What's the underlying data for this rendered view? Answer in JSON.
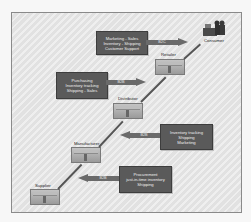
{
  "diagram": {
    "type": "supply-chain",
    "nodes": [
      {
        "id": "consumer",
        "label": "Consumer"
      },
      {
        "id": "retailer",
        "label": "Retailer"
      },
      {
        "id": "distributor",
        "label": "Distributor"
      },
      {
        "id": "manufacturer",
        "label": "Manufacturer"
      },
      {
        "id": "supplier",
        "label": "Supplier"
      }
    ],
    "infoboxes": [
      {
        "lines": [
          "Marketing - Sales",
          "Inventory - Shipping",
          "Customer Support"
        ],
        "arrow_label": "B2C",
        "direction": "right"
      },
      {
        "lines": [
          "Purchasing",
          "Inventory tracking",
          "Shipping - Sales"
        ],
        "arrow_label": "B2B",
        "direction": "right"
      },
      {
        "lines": [
          "Inventory tracking",
          "Shipping",
          "Marketing"
        ],
        "arrow_label": "B2B",
        "direction": "left"
      },
      {
        "lines": [
          "Procurement",
          "just-in-time inventory",
          "Shipping"
        ],
        "arrow_label": "B2B",
        "direction": "left"
      }
    ]
  },
  "colors": {
    "box_fill": "#5a5a5a",
    "arrow_fill": "#6a6a6a",
    "background": "#e6e6e6",
    "connector": "#555555"
  }
}
